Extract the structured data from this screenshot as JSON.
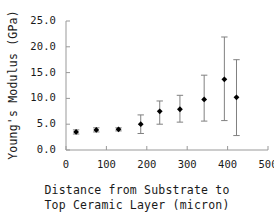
{
  "chart_data": {
    "type": "scatter",
    "title": "",
    "xlabel": "Distance from Substrate to Top Ceramic Layer (micron)",
    "xlabel_line1": "Distance from Substrate to",
    "xlabel_line2": "Top Ceramic Layer (micron)",
    "ylabel": "Young's Modulus (GPa)",
    "xlim": [
      0,
      500
    ],
    "ylim": [
      0,
      25
    ],
    "xticks": [
      0,
      100,
      200,
      300,
      400,
      500
    ],
    "xtick_labels": [
      "0",
      "100",
      "200",
      "300",
      "400",
      "500"
    ],
    "yticks": [
      0,
      5,
      10,
      15,
      20,
      25
    ],
    "ytick_labels": [
      "0.0",
      "5.0",
      "10.0",
      "15.0",
      "20.0",
      "25.0"
    ],
    "grid": false,
    "legend": false,
    "marker": "filled-diamond",
    "marker_color": "#000000",
    "errorbar_color": "#808080",
    "axis_color": "#999999",
    "x": [
      25,
      75,
      130,
      185,
      232,
      282,
      342,
      392,
      422
    ],
    "y": [
      3.5,
      3.9,
      4.0,
      5.0,
      7.5,
      7.9,
      9.8,
      13.7,
      10.2
    ],
    "y_err_upper": [
      0.4,
      0.4,
      0.3,
      1.8,
      2.0,
      2.7,
      4.7,
      8.2,
      7.3
    ],
    "y_err_lower": [
      0.4,
      0.4,
      0.3,
      1.8,
      2.5,
      2.5,
      4.2,
      8.0,
      7.4
    ]
  },
  "axes": {
    "plot_left_px": 66,
    "plot_right_px": 268,
    "plot_top_px": 21,
    "plot_bottom_px": 150
  }
}
